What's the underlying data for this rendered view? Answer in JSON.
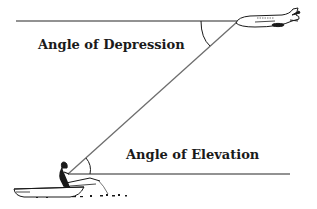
{
  "diagram": {
    "labels": {
      "depression": "Angle of Depression",
      "elevation": "Angle of Elevation"
    },
    "colors": {
      "line": "#6e6e6e",
      "ink": "#1a1a1a",
      "background": "#ffffff"
    },
    "objects": {
      "aircraft": "airplane-icon",
      "observer": "person-in-boat-icon"
    }
  }
}
